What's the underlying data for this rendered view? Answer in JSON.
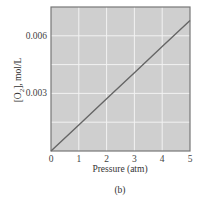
{
  "chart_data": {
    "type": "line",
    "title": "",
    "caption": "(b)",
    "xlabel": "Pressure (atm)",
    "ylabel": "[O2], mol/L",
    "ylabel_parts": {
      "prefix": "[O",
      "subscript": "2",
      "suffix": "], mol/L"
    },
    "xlim": [
      0,
      5
    ],
    "ylim": [
      0,
      0.0075
    ],
    "x_ticks": [
      "0",
      "1",
      "2",
      "3",
      "4",
      "5"
    ],
    "y_ticks": [
      "0.003",
      "0.006"
    ],
    "grid": true,
    "legend": null,
    "series": [
      {
        "name": "O2 solubility",
        "x": [
          0,
          1,
          2,
          3,
          4,
          5
        ],
        "values": [
          0,
          0.00136,
          0.00272,
          0.00408,
          0.00544,
          0.0068
        ]
      }
    ],
    "colors": {
      "plot_bg": "#cfcfcf",
      "grid": "#f2f2f2",
      "line": "#666666",
      "axis": "#777777"
    }
  }
}
